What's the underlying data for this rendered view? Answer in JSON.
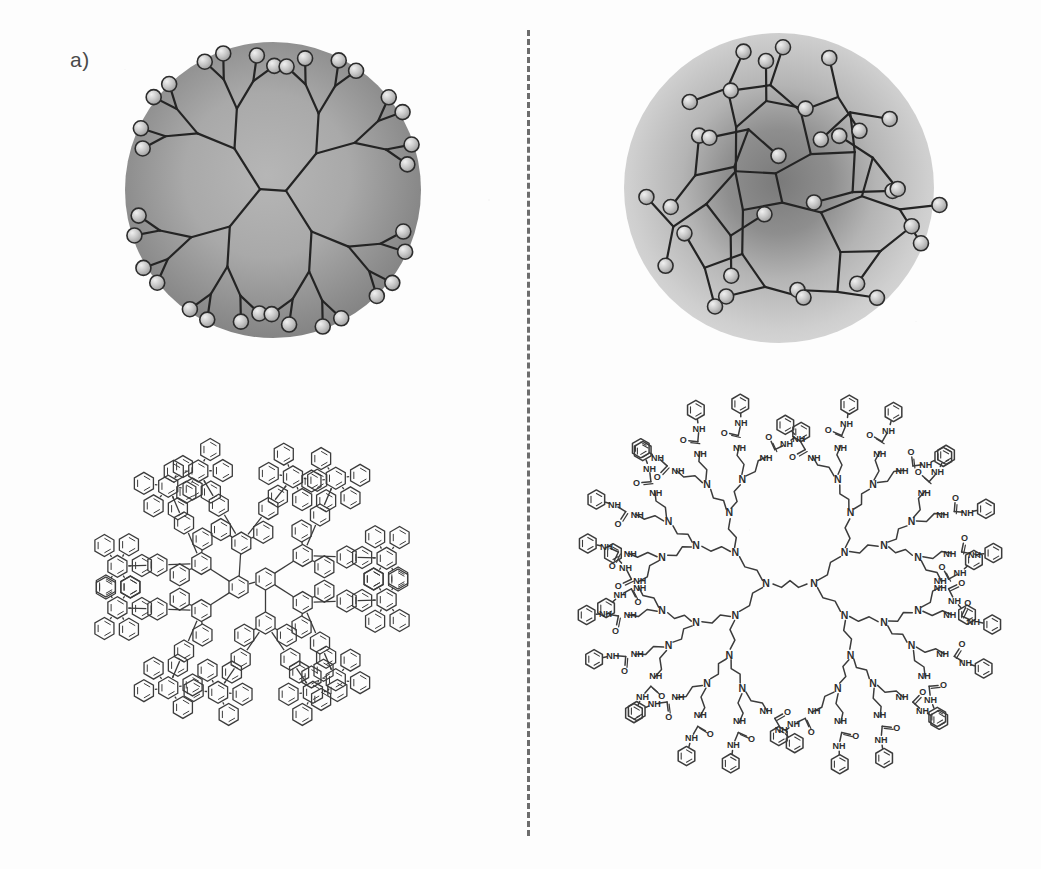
{
  "figure": {
    "type": "scientific-figure",
    "background_color": "#fdfdfd",
    "width": 1041,
    "height": 869,
    "divider": {
      "name": "vertical-dashed-divider",
      "style": "dashed",
      "color": "#6d6d6d",
      "x": 528,
      "y_start": 30,
      "y_end": 836
    }
  },
  "panels": [
    {
      "id": "a",
      "label": "a)",
      "label_color": "#4a4a4a",
      "schematic": {
        "name": "rigid-dendrimer-schematic",
        "description": "dense-shell rigid dendrimer: all end groups on the sphere surface",
        "sphere": {
          "cx": 273,
          "cy": 190,
          "r": 148,
          "fill_center": "#adadad",
          "fill_edge": "#7f7f7f",
          "gradient": "radial, lighter at center, darker toward rim"
        },
        "branch_color": "#2b2b2b",
        "branch_width": 2.2,
        "end_group": {
          "fill": "#c9c9c9",
          "stroke": "#303030",
          "radius": 7.5,
          "count": 32
        },
        "generations": 4,
        "core_branches": 2
      },
      "structure": {
        "name": "polyphenylene-dendrimer-structure",
        "chemistry": "polyphenylene dendrimer (rigid, shape-persistent)",
        "core": "biphenyl",
        "repeat_unit": "pentaphenylbenzene",
        "atom_labels": [],
        "stroke": "#3a3a3a",
        "bbox": {
          "x": 22,
          "y": 372,
          "w": 462,
          "h": 462
        }
      }
    },
    {
      "id": "b",
      "label": "b)",
      "label_color": "#4a4a4a",
      "schematic": {
        "name": "flexible-dendrimer-schematic",
        "description": "dense-core flexible dendrimer: end groups back-fold into the interior",
        "sphere": {
          "cx": 779,
          "cy": 188,
          "r": 155,
          "fill_center": "#7d7d7d",
          "fill_edge": "#d3d3d3",
          "gradient": "radial, dark dense core fading to light diffuse halo"
        },
        "branch_color": "#2b2b2b",
        "branch_width": 2.2,
        "end_group": {
          "fill": "#c9c9c9",
          "stroke": "#303030",
          "radius": 7.5,
          "count": 32
        },
        "generations": 4,
        "core_branches": 2
      },
      "structure": {
        "name": "ppi-phenylurea-dendrimer-structure",
        "chemistry": "poly(propylene imine) dendrimer with phenylurea end groups",
        "core": "1,4-diaminobutane",
        "repeat_unit": "propylene imine (N-CH2CH2CH2-)",
        "end_group": "NH-C(=O)-NH-phenyl (phenylurea)",
        "generation": 5,
        "end_group_count": 64,
        "atom_labels": [
          "N",
          "HN",
          "NH",
          "O",
          "H"
        ],
        "stroke": "#3a3a3a",
        "bbox": {
          "x": 552,
          "y": 374,
          "w": 470,
          "h": 458
        }
      }
    }
  ]
}
